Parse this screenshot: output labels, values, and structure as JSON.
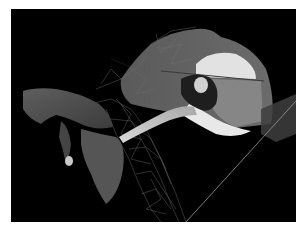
{
  "figure": {
    "colors": {
      "background": "#000000",
      "border": "#ffffff",
      "surface_dark": "#4a4a4a",
      "surface_mid": "#6e6e6e",
      "surface_light": "#9a9a9a",
      "highlight": "#e8e8e8",
      "wireframe": "#8c8c8c"
    }
  }
}
